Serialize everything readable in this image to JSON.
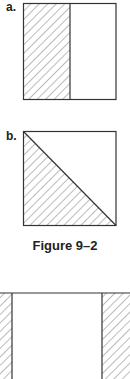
{
  "figure": {
    "caption": "Figure 9–2",
    "panels": [
      {
        "label": "a.",
        "shading": "left half hatched"
      },
      {
        "label": "b.",
        "shading": "lower-left triangle hatched"
      },
      {
        "label": "",
        "shading": "left and right edge strips hatched"
      }
    ],
    "colors": {
      "stroke": "#333333",
      "hatch": "#555555",
      "background": "#ffffff"
    }
  }
}
